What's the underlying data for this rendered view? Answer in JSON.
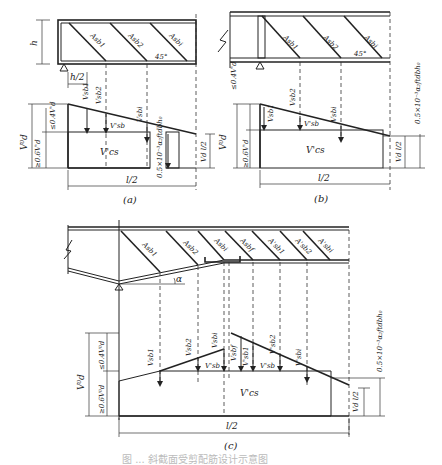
{
  "diagram": {
    "caption": "图 ... 斜截面受剪配筋设计示意图",
    "panels": [
      {
        "id": "a",
        "label": "(a)",
        "beam_labels": {
          "height": "h",
          "half_h": "h/2",
          "angle": "45°",
          "bars": [
            "Asb1",
            "Asb2",
            "Asbi"
          ]
        },
        "shear_labels": {
          "vd0": "V⁰d",
          "upper": "≤0.4V'd",
          "lower": "≥0.6V'd",
          "vsb1": "Vsb1",
          "vsb2": "Vsb2",
          "vsbi": "Vsbi",
          "vsb": "V'sb",
          "vcs": "V'cs",
          "limit": "0.5×10⁻³α₂ftdbh₀",
          "vd_half": "Vd l/2",
          "span": "l/2"
        }
      },
      {
        "id": "b",
        "label": "(b)",
        "beam_labels": {
          "angle": "45°",
          "bars": [
            "Asb1",
            "Asb2",
            "Asbi"
          ]
        },
        "shear_labels": {
          "vd0": "V⁰d",
          "upper": "≤0.4V'd",
          "lower": "≥0.6V'd",
          "vsb1": "Vsb1",
          "vsb2": "Vsb2",
          "vsbi": "Vsbi",
          "vsb": "V'sb",
          "vcs": "V'cs",
          "limit": "0.5×10⁻³α₂ftdbh₀",
          "vd_half": "Vd l/2",
          "span": "l/2"
        }
      },
      {
        "id": "c",
        "label": "(c)",
        "beam_labels": {
          "angle": "α",
          "bars": [
            "Asb1",
            "Asb2",
            "Asbi",
            "Asbf",
            "A'sb1",
            "A'sb2",
            "A'sbi"
          ]
        },
        "shear_labels": {
          "vd0": "V⁰d",
          "upper": "≤0.4V⁰d",
          "lower": "≥0.6V⁰d",
          "vsb1": "Vsb1",
          "vsb2": "Vsb2",
          "vsbi": "Vsbi",
          "vsbf": "Vsbf",
          "vsb1p": "V'sb1",
          "vsb2p": "V'sb2",
          "vsbip": "V'sbi",
          "vsb": "V'sb",
          "vcs": "V'cs",
          "limit": "0.5×10⁻³α₂ftdbh₀",
          "vd_half": "Vd l/2",
          "span": "l/2"
        }
      }
    ]
  }
}
